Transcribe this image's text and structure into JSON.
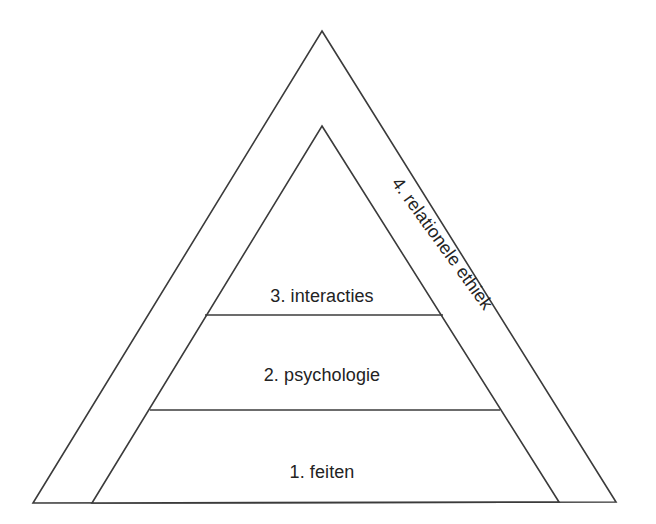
{
  "diagram": {
    "type": "nested-triangle-pyramid",
    "background_color": "#ffffff",
    "line_color": "#3b3b3b",
    "text_color": "#232323",
    "outer_triangle": {
      "name": "outer-triangle",
      "apex": {
        "x": 322,
        "y": 31
      },
      "base_left": {
        "x": 33,
        "y": 503
      },
      "base_right": {
        "x": 616,
        "y": 502
      }
    },
    "inner_triangle": {
      "name": "inner-triangle",
      "apex": {
        "x": 322,
        "y": 126
      },
      "base_left": {
        "x": 92,
        "y": 503
      },
      "base_right": {
        "x": 559,
        "y": 502
      }
    },
    "dividers": [
      {
        "name": "divider-interacties-psychologie",
        "x1": 205,
        "y1": 315,
        "x2": 443,
        "y2": 315
      },
      {
        "name": "divider-psychologie-feiten",
        "x1": 150,
        "y1": 410,
        "x2": 500,
        "y2": 410
      }
    ],
    "tiers": [
      {
        "id": "tier-3",
        "number": "3.",
        "name": "interacties",
        "label": "3. interacties",
        "cx": 322,
        "baseline_y": 302
      },
      {
        "id": "tier-2",
        "number": "2.",
        "name": "psychologie",
        "label": "2. psychologie",
        "cx": 322,
        "baseline_y": 381
      },
      {
        "id": "tier-1",
        "number": "1.",
        "name": "feiten",
        "label": "1. feiten",
        "cx": 322,
        "baseline_y": 478
      }
    ],
    "edge_band_label": {
      "id": "tier-4",
      "number": "4.",
      "name": "relationele ethiek",
      "label": "4. relationele ethiek",
      "anchor_x": 391,
      "anchor_y": 183,
      "rotation_deg": 54
    }
  }
}
